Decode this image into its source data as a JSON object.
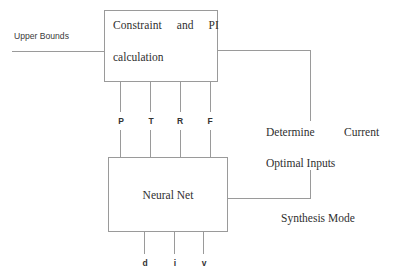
{
  "diagram": {
    "background_color": "#ffffff",
    "line_color": "#9a9a9a",
    "text_color": "#2f2f2f"
  },
  "blocks": {
    "constraint": {
      "line1": "Constraint     and     PI",
      "line2": "calculation"
    },
    "neural": {
      "label": "Neural Net"
    }
  },
  "inputs": {
    "upper_bounds": "Upper Bounds"
  },
  "signals": {
    "middle": [
      {
        "name": "P"
      },
      {
        "name": "T"
      },
      {
        "name": "R"
      },
      {
        "name": "F"
      }
    ],
    "outputs": [
      {
        "name": "d"
      },
      {
        "name": "i"
      },
      {
        "name": "v"
      }
    ]
  },
  "annotations": {
    "determine": "Determine",
    "current": "Current",
    "optimal_inputs": "Optimal Inputs",
    "synthesis_mode": "Synthesis Mode"
  }
}
